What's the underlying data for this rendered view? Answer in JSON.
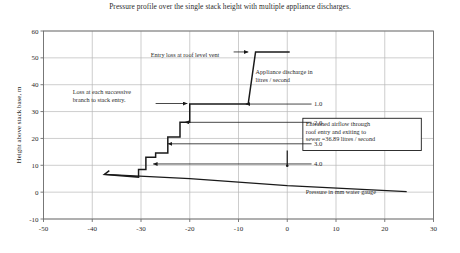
{
  "chart_data": {
    "type": "line",
    "title": "Pressure profile over the single stack height with multiple appliance discharges.",
    "xlabel": "Pressure in mm water gauge",
    "ylabel": "Height above stack base, m",
    "xlim": [
      -50,
      30
    ],
    "ylim": [
      -10,
      60
    ],
    "xticks": [
      -50,
      -40,
      -30,
      -20,
      -10,
      0,
      10,
      20,
      30
    ],
    "yticks": [
      -10,
      0,
      10,
      20,
      30,
      40,
      50,
      60
    ],
    "grid": true,
    "legend": "none",
    "series": [
      {
        "name": "Stack pressure profile",
        "comment": "Staircase profile, x = pressure (mm water gauge), y = height above stack base (m)",
        "points": [
          [
            -36.5,
            8.0
          ],
          [
            -37.5,
            6.6
          ],
          [
            -30.5,
            5.6
          ],
          [
            -30.5,
            8.4
          ],
          [
            -29.0,
            8.4
          ],
          [
            -29.0,
            13.0
          ],
          [
            -27.0,
            13.0
          ],
          [
            -27.0,
            14.6
          ],
          [
            -24.5,
            14.6
          ],
          [
            -24.5,
            20.5
          ],
          [
            -22.0,
            20.5
          ],
          [
            -22.0,
            26.0
          ],
          [
            -20.0,
            26.0
          ],
          [
            -20.0,
            32.8
          ],
          [
            -8.0,
            32.8
          ],
          [
            -8.0,
            33.0
          ],
          [
            -6.5,
            52.2
          ],
          [
            0.5,
            52.2
          ]
        ]
      },
      {
        "name": "Sewer / base pressure line",
        "comment": "Gently sloping line from the stack base toward the sewer outlet",
        "points": [
          [
            -37.5,
            6.6
          ],
          [
            -20.0,
            5.0
          ],
          [
            0.0,
            2.4
          ],
          [
            24.5,
            0.2
          ]
        ]
      }
    ],
    "annotations": [
      {
        "name": "entry-loss-annotation",
        "text": "Entry loss at roof level vent",
        "x_text": -28.0,
        "y_text": 50.5,
        "arrow_to_x": -8.0,
        "arrow_to_y": 52.2
      },
      {
        "name": "branch-loss-annotation",
        "text": "Loss at each successive branch to stack entry.",
        "x_text": -44.0,
        "y_text": 36.5,
        "arrow_to_x": -20.5,
        "arrow_to_y": 33.0
      },
      {
        "name": "appliance-discharge-annotation",
        "text": "Appliance discharge in litres / second",
        "x_text": -6.5,
        "y_text": 44.0
      },
      {
        "name": "entrained-airflow-annotation",
        "text": "Entrained airflow through roof entry and exiting to sewer =36.89 litres / second",
        "x_text": 6.0,
        "y_text": 22.0,
        "arrow_to_x": 0.0,
        "arrow_to_y": 10.5
      },
      {
        "name": "pressure-axis-annotation",
        "text": "Pressure in mm water gauge",
        "x_text": 11.0,
        "y_text": 1.0
      }
    ],
    "discharge_labels": [
      {
        "label": "1.0",
        "x_text": 5.5,
        "y_text": 32.8,
        "arrow_to_x": -8.5,
        "arrow_to_y": 32.8
      },
      {
        "label": "2.0",
        "x_text": 5.5,
        "y_text": 26.0,
        "arrow_to_x": -21.0,
        "arrow_to_y": 26.0
      },
      {
        "label": "3.0",
        "x_text": 5.5,
        "y_text": 18.0,
        "arrow_to_x": -24.5,
        "arrow_to_y": 18.0
      },
      {
        "label": "4.0",
        "x_text": 5.5,
        "y_text": 10.5,
        "arrow_to_x": -27.5,
        "arrow_to_y": 10.5
      }
    ]
  },
  "style": {
    "series_color": "#1a1a1a",
    "grid_color": "#b8b8b8",
    "axis_color": "#6e6e6e",
    "text_color": "#2b2b2b"
  }
}
